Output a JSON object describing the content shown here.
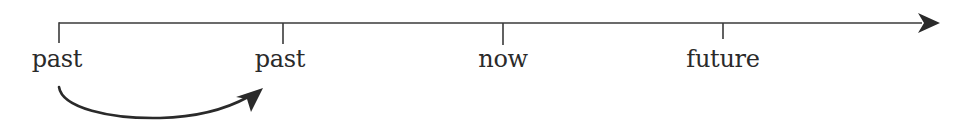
{
  "diagram": {
    "type": "timeline",
    "axis": {
      "direction": "left-to-right",
      "arrow_end": "right"
    },
    "ticks": [
      {
        "label": "past",
        "x": 59
      },
      {
        "label": "past",
        "x": 283
      },
      {
        "label": "now",
        "x": 503
      },
      {
        "label": "future",
        "x": 723
      }
    ],
    "curved_arrow": {
      "from_tick": 0,
      "to_tick": 1,
      "description": "curved arrow from first 'past' to second 'past'"
    },
    "colors": {
      "line": "#3a3a3a",
      "text": "#2a2a2a",
      "background": "#ffffff"
    }
  }
}
